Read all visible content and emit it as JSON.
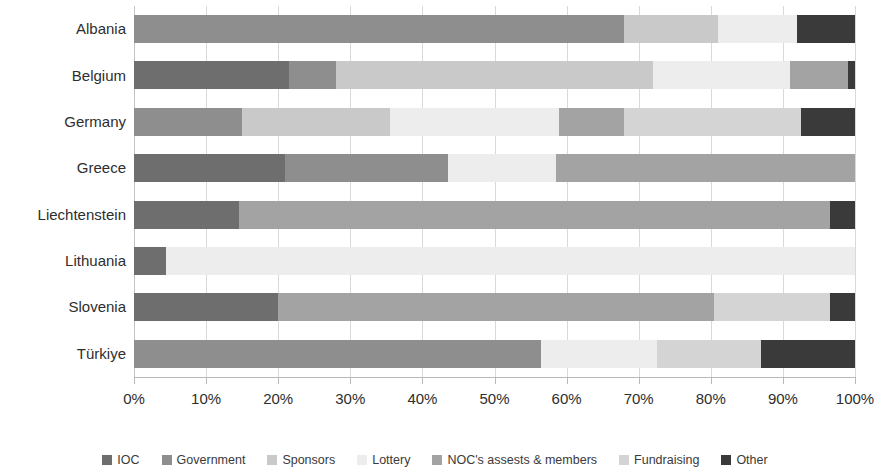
{
  "chart_data": {
    "type": "bar",
    "orientation": "horizontal",
    "stacked": true,
    "normalized": true,
    "title": "",
    "xlabel": "",
    "ylabel": "",
    "xlim": [
      0,
      100
    ],
    "xticks": [
      0,
      10,
      20,
      30,
      40,
      50,
      60,
      70,
      80,
      90,
      100
    ],
    "xtick_labels": [
      "0%",
      "10%",
      "20%",
      "30%",
      "40%",
      "50%",
      "60%",
      "70%",
      "80%",
      "90%",
      "100%"
    ],
    "grid": true,
    "grid_axis": "x",
    "legend_position": "bottom",
    "categories": [
      "Albania",
      "Belgium",
      "Germany",
      "Greece",
      "Liechtenstein",
      "Lithuania",
      "Slovenia",
      "Türkiye"
    ],
    "series": [
      {
        "name": "IOC",
        "color": "#6e6e6e",
        "values": [
          0,
          21.5,
          0,
          21.0,
          14.5,
          4.5,
          20.0,
          0
        ]
      },
      {
        "name": "Government",
        "color": "#8e8e8e",
        "values": [
          68.0,
          6.5,
          15.0,
          22.5,
          0,
          0,
          0,
          56.5
        ]
      },
      {
        "name": "Sponsors",
        "color": "#c9c9c9",
        "values": [
          13.0,
          44.0,
          20.5,
          0,
          0,
          0,
          0,
          0
        ]
      },
      {
        "name": "Lottery",
        "color": "#ededed",
        "values": [
          11.0,
          19.0,
          23.5,
          15.0,
          0,
          95.5,
          0,
          16.0
        ]
      },
      {
        "name": "NOC's assests & members",
        "color": "#a3a3a3",
        "values": [
          0,
          8.0,
          9.0,
          41.5,
          82.0,
          0,
          60.5,
          0
        ]
      },
      {
        "name": "Fundraising",
        "color": "#d4d4d4",
        "values": [
          0,
          0,
          24.5,
          0,
          0,
          0,
          16.0,
          14.5
        ]
      },
      {
        "name": "Other",
        "color": "#3a3a3a",
        "values": [
          8.0,
          1.0,
          7.5,
          0,
          3.5,
          0,
          3.5,
          13.0
        ]
      }
    ]
  },
  "axis": {
    "tick_labels": [
      "0%",
      "10%",
      "20%",
      "30%",
      "40%",
      "50%",
      "60%",
      "70%",
      "80%",
      "90%",
      "100%"
    ]
  },
  "categories": [
    "Albania",
    "Belgium",
    "Germany",
    "Greece",
    "Liechtenstein",
    "Lithuania",
    "Slovenia",
    "Türkiye"
  ],
  "legend": {
    "items": [
      {
        "label": "IOC",
        "color": "#6e6e6e"
      },
      {
        "label": "Government",
        "color": "#8e8e8e"
      },
      {
        "label": "Sponsors",
        "color": "#c9c9c9"
      },
      {
        "label": "Lottery",
        "color": "#ededed"
      },
      {
        "label": "NOC's assests & members",
        "color": "#a3a3a3"
      },
      {
        "label": "Fundraising",
        "color": "#d4d4d4"
      },
      {
        "label": "Other",
        "color": "#3a3a3a"
      }
    ]
  }
}
